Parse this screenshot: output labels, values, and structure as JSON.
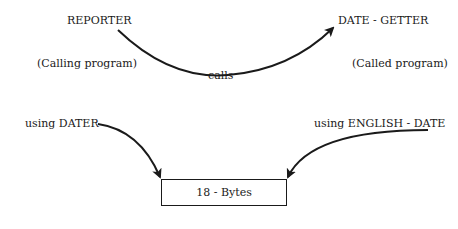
{
  "diagram": {
    "caller": {
      "name": "REPORTER",
      "role": "(Calling program)"
    },
    "callee": {
      "name": "DATE - GETTER",
      "role": "(Called program)"
    },
    "call_edge_label": "calls",
    "caller_param": "using DATER",
    "callee_param": "using ENGLISH - DATE",
    "shared_storage": "18 - Bytes"
  }
}
